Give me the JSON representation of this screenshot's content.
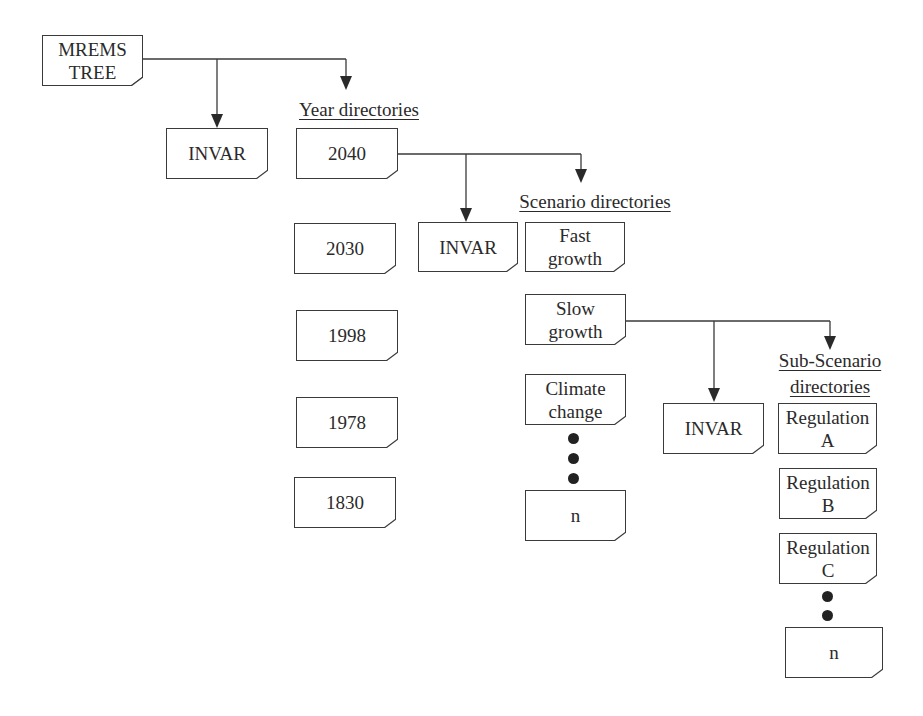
{
  "diagram": {
    "stroke_color": "#3a3a3a",
    "background": "#ffffff",
    "root": {
      "label_lines": [
        "MREMS",
        "TREE"
      ]
    },
    "headings": {
      "year": "Year directories",
      "scenario": "Scenario directories",
      "subscenario_line1": "Sub-Scenario",
      "subscenario_line2": "directories"
    },
    "level1": {
      "invar": {
        "label": "INVAR"
      },
      "years": [
        {
          "label": "2040"
        },
        {
          "label": "2030"
        },
        {
          "label": "1998"
        },
        {
          "label": "1978"
        },
        {
          "label": "1830"
        }
      ]
    },
    "level2": {
      "invar": {
        "label": "INVAR"
      },
      "scenarios": [
        {
          "label_lines": [
            "Fast",
            "growth"
          ]
        },
        {
          "label_lines": [
            "Slow",
            "growth"
          ]
        },
        {
          "label_lines": [
            "Climate",
            "change"
          ]
        },
        {
          "label": "n"
        }
      ]
    },
    "level3": {
      "invar": {
        "label": "INVAR"
      },
      "subscenarios": [
        {
          "label_lines": [
            "Regulation",
            "A"
          ]
        },
        {
          "label_lines": [
            "Regulation",
            "B"
          ]
        },
        {
          "label_lines": [
            "Regulation",
            "C"
          ]
        },
        {
          "label": "n"
        }
      ]
    },
    "ellipsis_icon": "vertical-dots"
  }
}
